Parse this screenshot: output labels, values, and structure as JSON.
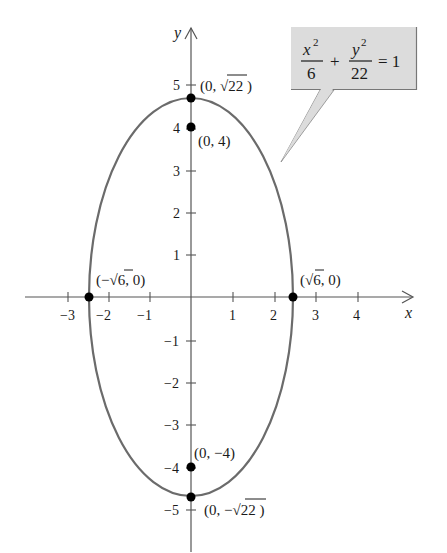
{
  "diagram": {
    "type": "ellipse-graph",
    "equation": {
      "term1_num": "x",
      "term1_num_exp": "2",
      "term1_den": "6",
      "plus": "+",
      "term2_num": "y",
      "term2_num_exp": "2",
      "term2_den": "22",
      "rhs": "= 1"
    },
    "axes": {
      "x_label": "x",
      "y_label": "y",
      "x_ticks": [
        "−3",
        "−2",
        "−1",
        "1",
        "2",
        "3",
        "4"
      ],
      "y_ticks_pos": [
        "1",
        "2",
        "3",
        "4",
        "5"
      ],
      "y_ticks_neg": [
        "−1",
        "−2",
        "−3",
        "−4",
        "−5"
      ]
    },
    "points": {
      "top_vertex": "(0, √22 )",
      "focus_top": "(0, 4)",
      "left_vertex": "(−√6, 0)",
      "right_vertex": "(√6, 0)",
      "focus_bottom": "(0, −4)",
      "bottom_vertex": "(0, −√22 )"
    },
    "colors": {
      "ellipse": "#6b6b6b",
      "callout_fill": "#dcdcdc",
      "axis": "#555555",
      "point": "#000000"
    }
  }
}
